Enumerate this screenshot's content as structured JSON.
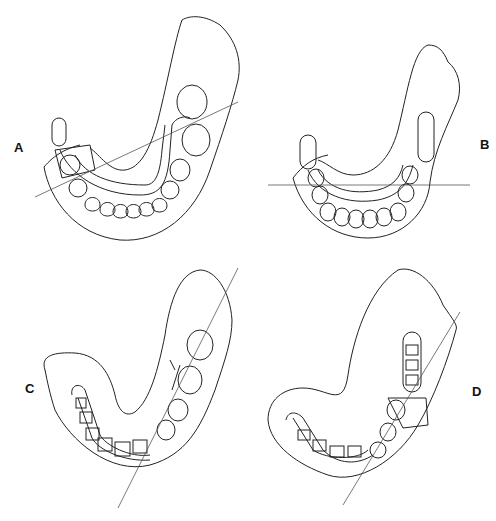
{
  "figure": {
    "panels": [
      {
        "id": "A",
        "label": "A",
        "reference_line": "oblique line through arch"
      },
      {
        "id": "B",
        "label": "B",
        "reference_line": "horizontal line"
      },
      {
        "id": "C",
        "label": "C",
        "reference_line": "steep oblique line"
      },
      {
        "id": "D",
        "label": "D",
        "reference_line": "steep oblique line"
      }
    ]
  }
}
